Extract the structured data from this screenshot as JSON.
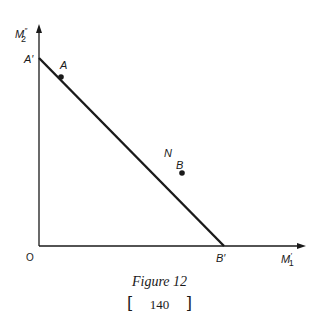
{
  "figure": {
    "caption": "Figure 12",
    "page_number": "140",
    "page_bracket_left": "[",
    "page_bracket_right": "]",
    "axes": {
      "y_label_main": "M",
      "y_label_sup": "″",
      "y_label_sub": "2",
      "x_label_main": "M",
      "x_label_sup": "′",
      "x_label_sub": "1",
      "origin_label": "O"
    },
    "points": {
      "a_prime": "A′",
      "a": "A",
      "n": "N",
      "b": "B",
      "b_prime": "B′"
    },
    "colors": {
      "ink": "#1a1a1a",
      "background": "#ffffff"
    }
  }
}
